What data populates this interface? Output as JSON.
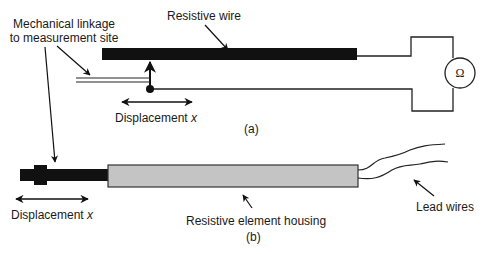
{
  "diagram": {
    "type": "potentiometric displacement sensor schematic",
    "colors": {
      "wire": "#111111",
      "line": "#222222",
      "housing_fill": "#c4c4c4",
      "housing_stroke": "#333333",
      "background": "#ffffff"
    },
    "panel_a": {
      "caption": "(a)",
      "labels": {
        "resistive_wire": "Resistive wire",
        "linkage_line1": "Mechanical linkage",
        "linkage_line2": "to measurement site",
        "displacement": "Displacement",
        "displacement_var": "x"
      },
      "meter_symbol": "Ω"
    },
    "panel_b": {
      "caption": "(b)",
      "labels": {
        "displacement": "Displacement",
        "displacement_var": "x",
        "housing": "Resistive element housing",
        "lead_wires": "Lead wires"
      }
    }
  }
}
